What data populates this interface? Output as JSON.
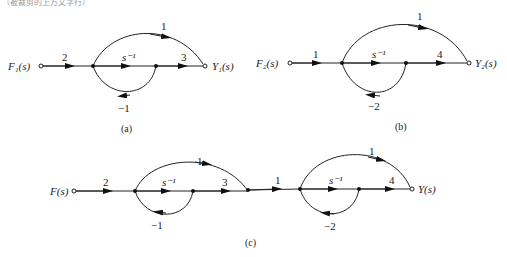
{
  "header_fragment": "（被裁剪的上方文字行）",
  "diagrams": {
    "a": {
      "caption": "(a)",
      "input_label": "F₁(s)",
      "output_label": "Y₁(s)",
      "gains": {
        "input": "2",
        "forward": "s⁻¹",
        "output": "3",
        "feedforward": "1",
        "feedback": "−1"
      }
    },
    "b": {
      "caption": "(b)",
      "input_label": "F₂(s)",
      "output_label": "Y₂(s)",
      "gains": {
        "input": "1",
        "forward": "s⁻¹",
        "output": "4",
        "feedforward": "1",
        "feedback": "−2"
      }
    },
    "c": {
      "caption": "(c)",
      "input_label": "F(s)",
      "output_label": "Y(s)",
      "gains": {
        "input": "2",
        "forward1": "s⁻¹",
        "out1": "3",
        "feedforward1": "1",
        "feedback1": "−1",
        "link": "1",
        "forward2": "s⁻¹",
        "out2": "4",
        "feedforward2": "1",
        "feedback2": "−2"
      }
    }
  },
  "colors": {
    "line": "#222222",
    "background": "#ffffff"
  }
}
